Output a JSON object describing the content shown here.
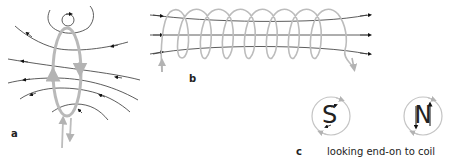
{
  "figure": {
    "panels": [
      {
        "id": "a",
        "label": "a",
        "description": "single current loop with magnetic field lines"
      },
      {
        "id": "b",
        "label": "b",
        "description": "solenoid coil with field lines passing through"
      },
      {
        "id": "c",
        "label": "c",
        "caption": "looking end-on to coil",
        "poles": [
          {
            "letter": "S",
            "current_direction": "clockwise"
          },
          {
            "letter": "N",
            "current_direction": "anticlockwise"
          }
        ]
      }
    ],
    "colors": {
      "coil": "#b9b9b9",
      "field_line": "#333333",
      "arrow": "#111111",
      "text": "#222222"
    }
  }
}
